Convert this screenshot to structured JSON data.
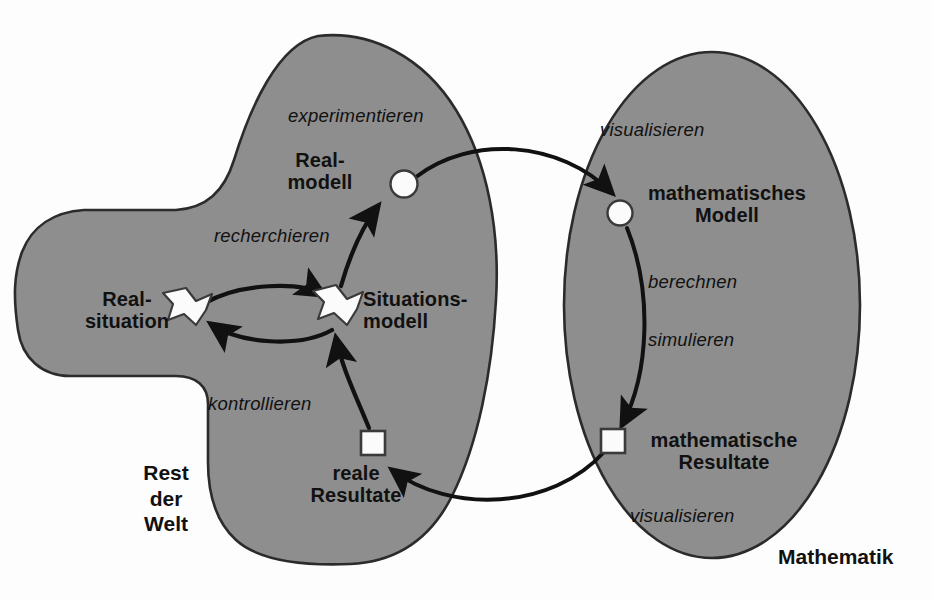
{
  "diagram": {
    "colors": {
      "region_fill": "#8e8e8e",
      "region_stroke": "#2b2b2b",
      "arrow": "#111111",
      "node_fill": "#fbfbfb",
      "node_stroke": "#2b2b2b",
      "text": "#111111",
      "background": "#fdfdfd"
    },
    "regions": [
      {
        "id": "rest-der-welt",
        "label": "Rest\nder\nWelt",
        "shape": "blob"
      },
      {
        "id": "mathematik",
        "label": "Mathematik",
        "shape": "ellipse"
      }
    ],
    "nodes": [
      {
        "id": "realsituation",
        "label": "Real-\nsituation",
        "marker": "star",
        "region": "rest-der-welt"
      },
      {
        "id": "situationsmodell",
        "label": "Situations-\nmodell",
        "marker": "star",
        "region": "rest-der-welt"
      },
      {
        "id": "realmodell",
        "label": "Real-\nmodell",
        "marker": "circle",
        "region": "rest-der-welt"
      },
      {
        "id": "reale-resultate",
        "label": "reale\nResultate",
        "marker": "square",
        "region": "rest-der-welt"
      },
      {
        "id": "mathematisches-modell",
        "label": "mathematisches\nModell",
        "marker": "circle",
        "region": "mathematik"
      },
      {
        "id": "mathematische-resultate",
        "label": "mathematische\nResultate",
        "marker": "square",
        "region": "mathematik"
      }
    ],
    "edges": [
      {
        "id": "vereinfachen",
        "label": "",
        "from": "realsituation",
        "to": "situationsmodell"
      },
      {
        "id": "verstehen",
        "label": "",
        "from": "situationsmodell",
        "to": "realsituation"
      },
      {
        "id": "recherchieren",
        "label": "recherchieren",
        "from": "situationsmodell",
        "to": "realmodell"
      },
      {
        "id": "experimentieren",
        "label": "experimentieren",
        "from": "realmodell",
        "to": "realmodell"
      },
      {
        "id": "mathematisieren",
        "label": "",
        "from": "realmodell",
        "to": "mathematisches-modell"
      },
      {
        "id": "visualisieren-oben",
        "label": "visualisieren",
        "from": "realmodell",
        "to": "mathematisches-modell"
      },
      {
        "id": "berechnen",
        "label": "berechnen",
        "from": "mathematisches-modell",
        "to": "mathematische-resultate"
      },
      {
        "id": "simulieren",
        "label": "simulieren",
        "from": "mathematisches-modell",
        "to": "mathematische-resultate"
      },
      {
        "id": "interpretieren",
        "label": "",
        "from": "mathematische-resultate",
        "to": "reale-resultate"
      },
      {
        "id": "visualisieren-unten",
        "label": "visualisieren",
        "from": "mathematische-resultate",
        "to": "reale-resultate"
      },
      {
        "id": "kontrollieren",
        "label": "kontrollieren",
        "from": "reale-resultate",
        "to": "situationsmodell"
      }
    ],
    "labels": {
      "experimentieren": "experimentieren",
      "recherchieren": "recherchieren",
      "kontrollieren": "kontrollieren",
      "visualisieren_top": "visualisieren",
      "visualisieren_bottom": "visualisieren",
      "berechnen": "berechnen",
      "simulieren": "simulieren",
      "realmodell": "Real-\nmodell",
      "realsituation": "Real-\nsituation",
      "situationsmodell": "Situations-\nmodell",
      "reale_resultate": "reale\nResultate",
      "math_modell": "mathematisches\nModell",
      "math_resultate": "mathematische\nResultate",
      "rest_der_welt": "Rest\nder\nWelt",
      "mathematik": "Mathematik"
    }
  }
}
